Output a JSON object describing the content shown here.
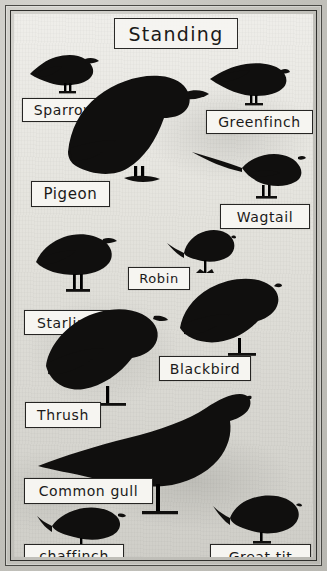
{
  "poster": {
    "title": "Standing",
    "media": "hand-drawn bird silhouette identification chart",
    "frame_color": "#2f2f2c",
    "silhouette_color": "#100f0e",
    "paper_color": "#e7e6e0",
    "label_box_color": "#f6f5f1"
  },
  "birds": [
    {
      "id": "sparrow",
      "label": "Sparrow",
      "icon": "sparrow-silhouette-icon"
    },
    {
      "id": "greenfinch",
      "label": "Greenfinch",
      "icon": "greenfinch-silhouette-icon"
    },
    {
      "id": "pigeon",
      "label": "Pigeon",
      "icon": "pigeon-silhouette-icon"
    },
    {
      "id": "wagtail",
      "label": "Wagtail",
      "icon": "wagtail-silhouette-icon"
    },
    {
      "id": "robin",
      "label": "Robin",
      "icon": "robin-silhouette-icon"
    },
    {
      "id": "starling",
      "label": "Starling",
      "icon": "starling-silhouette-icon"
    },
    {
      "id": "blackbird",
      "label": "Blackbird",
      "icon": "blackbird-silhouette-icon"
    },
    {
      "id": "thrush",
      "label": "Thrush",
      "icon": "thrush-silhouette-icon"
    },
    {
      "id": "common-gull",
      "label": "Common gull",
      "icon": "gull-silhouette-icon"
    },
    {
      "id": "chaffinch",
      "label": "chaffinch",
      "icon": "chaffinch-silhouette-icon"
    },
    {
      "id": "great-tit",
      "label": "Great tit",
      "icon": "great-tit-silhouette-icon"
    }
  ]
}
